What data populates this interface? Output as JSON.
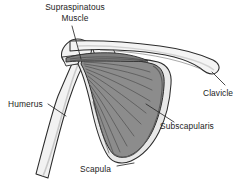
{
  "figure": {
    "kind": "anatomical-illustration",
    "width": 244,
    "height": 188,
    "background_color": "#ffffff"
  },
  "palette": {
    "outline": "#2b2b2b",
    "bone_fill": "#f2f2f2",
    "bone_shade": "#d9d9d9",
    "muscle_fill": "#8c8c8c",
    "muscle_fiber": "#4a4a4a",
    "muscle_dark": "#6f6f6f",
    "scapula_border": "#e4e4e4",
    "leader_line": "#2b2b2b",
    "text": "#1c1c1c"
  },
  "labels": [
    {
      "id": "supraspinatous-muscle",
      "line1": "Supraspinatous",
      "line2": "Muscle",
      "x": 30,
      "y": 2,
      "align": "center",
      "leader": "from text down-right to muscle belly under clavicle"
    },
    {
      "id": "clavicle",
      "text": "Clavicle",
      "x": 203,
      "y": 88,
      "align": "left",
      "leader": "from text up-left to lateral clavicle shaft"
    },
    {
      "id": "humerus",
      "text": "Humerus",
      "x": 8,
      "y": 99,
      "align": "left",
      "leader": "from text right-down to humeral shaft"
    },
    {
      "id": "subscapularis",
      "text": "Subscapularis",
      "x": 160,
      "y": 121,
      "align": "left",
      "leader": "from text up-left into the muscle body"
    },
    {
      "id": "scapula",
      "text": "Scapula",
      "x": 80,
      "y": 164,
      "align": "left",
      "leader": "short dash right to inferior angle of scapula"
    }
  ],
  "structures": [
    {
      "id": "clavicle-bone",
      "name": "Clavicle",
      "tone": "bone"
    },
    {
      "id": "humerus-bone",
      "name": "Humerus",
      "tone": "bone"
    },
    {
      "id": "humeral-head",
      "name": "Head of humerus",
      "tone": "bone"
    },
    {
      "id": "coracoid-process",
      "name": "Coracoid process",
      "tone": "bone"
    },
    {
      "id": "scapula-bone",
      "name": "Scapula",
      "tone": "bone"
    },
    {
      "id": "supraspinatus-muscle",
      "name": "Supraspinatous muscle",
      "tone": "muscle"
    },
    {
      "id": "subscapularis-muscle",
      "name": "Subscapularis muscle",
      "tone": "muscle"
    }
  ]
}
